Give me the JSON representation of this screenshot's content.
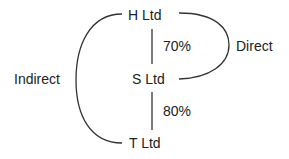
{
  "nodes": {
    "h": "H Ltd",
    "s": "S Ltd",
    "t": "T Ltd"
  },
  "edges": {
    "h_s": "70%",
    "s_t": "80%"
  },
  "annotations": {
    "direct": "Direct",
    "indirect": "Indirect"
  }
}
